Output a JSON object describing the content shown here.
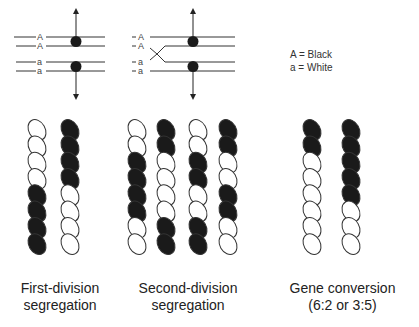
{
  "diagram": {
    "first_division_chromosomes": {
      "labels": [
        "A",
        "A",
        "a",
        "a"
      ]
    },
    "second_division_chromosomes": {
      "labels": [
        "A",
        "A",
        "a",
        "a"
      ]
    },
    "legend": {
      "line1": "A = Black",
      "line2": "a = White"
    },
    "asci": [
      {
        "name": "First-division segregation",
        "caption_line1": "First-division",
        "caption_line2": "segregation",
        "columns": [
          [
            "white",
            "white",
            "white",
            "white",
            "black",
            "black",
            "black",
            "black"
          ],
          [
            "black",
            "black",
            "black",
            "black",
            "white",
            "white",
            "white",
            "white"
          ]
        ]
      },
      {
        "name": "Second-division segregation",
        "caption_line1": "Second-division",
        "caption_line2": "segregation",
        "columns": [
          [
            "white",
            "white",
            "black",
            "black",
            "black",
            "black",
            "white",
            "white"
          ],
          [
            "black",
            "black",
            "white",
            "white",
            "white",
            "white",
            "black",
            "black"
          ],
          [
            "white",
            "white",
            "black",
            "black",
            "white",
            "white",
            "black",
            "black"
          ],
          [
            "black",
            "black",
            "white",
            "white",
            "black",
            "black",
            "white",
            "white"
          ]
        ]
      },
      {
        "name": "Gene conversion",
        "caption_line1": "Gene conversion",
        "caption_line2": "(6:2 or 3:5)",
        "columns": [
          [
            "black",
            "black",
            "white",
            "white",
            "white",
            "white",
            "white",
            "white"
          ],
          [
            "black",
            "black",
            "black",
            "black",
            "black",
            "white",
            "white",
            "white"
          ]
        ]
      }
    ],
    "colors": {
      "black": "#1a1a1a",
      "white": "#ffffff",
      "line": "#333333"
    }
  }
}
